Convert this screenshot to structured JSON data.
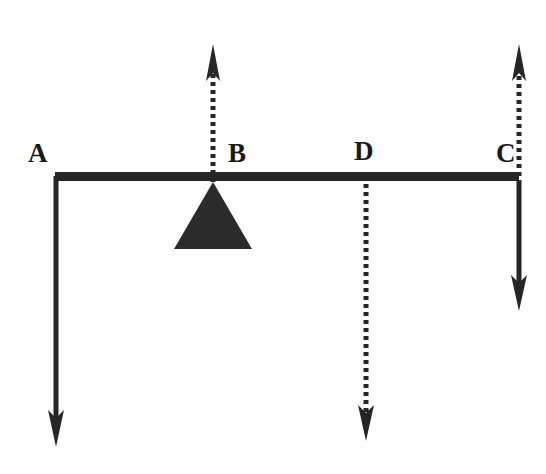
{
  "figure": {
    "background_color": "#ffffff",
    "stroke_color": "#262626",
    "beam": {
      "name": "lever-beam",
      "x1": 55,
      "x2": 519,
      "y": 176,
      "thickness": 8
    },
    "fulcrum": {
      "name": "fulcrum-triangle",
      "apex_x": 213,
      "apex_y": 182,
      "base_left_x": 174,
      "base_right_x": 252,
      "base_y": 249
    },
    "points": [
      {
        "id": "A",
        "label": "A",
        "label_x": 28,
        "label_y": 140,
        "x": 55,
        "line_style": "solid",
        "direction": "down",
        "tail_y": 176,
        "tip_y": 447
      },
      {
        "id": "B",
        "label": "B",
        "label_x": 228,
        "label_y": 140,
        "x": 213,
        "line_style": "dotted",
        "direction": "up",
        "tail_y": 182,
        "tip_y": 44
      },
      {
        "id": "D",
        "label": "D",
        "label_x": 354,
        "label_y": 138,
        "x": 366,
        "line_style": "dotted",
        "direction": "down",
        "tail_y": 176,
        "tip_y": 441
      },
      {
        "id": "C",
        "label": "C",
        "label_x": 496,
        "label_y": 140,
        "x": 519,
        "line_style": "solid",
        "direction": "down",
        "tail_y": 180,
        "tip_y": 311
      },
      {
        "id": "C-up",
        "label": "",
        "label_x": 0,
        "label_y": 0,
        "x": 519,
        "line_style": "dotted",
        "direction": "up",
        "tail_y": 176,
        "tip_y": 44
      }
    ]
  }
}
